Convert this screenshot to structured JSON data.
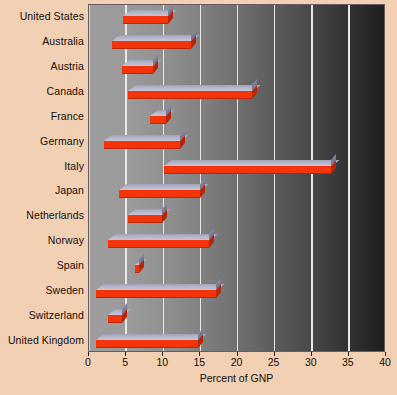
{
  "chart_data": {
    "type": "bar",
    "orientation": "horizontal",
    "title": "",
    "xlabel": "Percent of GNP",
    "ylabel": "",
    "xlim": [
      0,
      40
    ],
    "xticks": [
      0,
      5,
      10,
      15,
      20,
      25,
      30,
      35,
      40
    ],
    "xtick_labels": [
      "0",
      "5",
      "10",
      "15",
      "20",
      "25",
      "30",
      "35",
      "40"
    ],
    "grid": true,
    "legend": false,
    "note": "Floating (range) bars: each country bar spans from a start value to an end value on the Percent of GNP axis.",
    "categories": [
      "United States",
      "Australia",
      "Austria",
      "Canada",
      "France",
      "Germany",
      "Italy",
      "Japan",
      "Netherlands",
      "Norway",
      "Spain",
      "Sweden",
      "Switzerland",
      "United Kingdom"
    ],
    "bars": [
      {
        "category": "United States",
        "start": 4.6,
        "end": 10.7,
        "value": 6.1
      },
      {
        "category": "Australia",
        "start": 3.1,
        "end": 13.7,
        "value": 10.6
      },
      {
        "category": "Austria",
        "start": 4.4,
        "end": 8.6,
        "value": 4.2
      },
      {
        "category": "Canada",
        "start": 5.3,
        "end": 22.0,
        "value": 16.7
      },
      {
        "category": "France",
        "start": 8.2,
        "end": 10.4,
        "value": 2.2
      },
      {
        "category": "Germany",
        "start": 2.0,
        "end": 12.2,
        "value": 10.2
      },
      {
        "category": "Italy",
        "start": 10.1,
        "end": 32.6,
        "value": 22.5
      },
      {
        "category": "Japan",
        "start": 4.1,
        "end": 15.0,
        "value": 10.9
      },
      {
        "category": "Netherlands",
        "start": 5.2,
        "end": 9.8,
        "value": 4.6
      },
      {
        "category": "Norway",
        "start": 2.6,
        "end": 16.2,
        "value": 13.6
      },
      {
        "category": "Spain",
        "start": 6.2,
        "end": 6.8,
        "value": 0.6
      },
      {
        "category": "Sweden",
        "start": 1.0,
        "end": 17.1,
        "value": 16.1
      },
      {
        "category": "Switzerland",
        "start": 2.5,
        "end": 4.5,
        "value": 2.0
      },
      {
        "category": "United Kingdom",
        "start": 1.0,
        "end": 14.7,
        "value": 13.7
      }
    ],
    "colors": {
      "bar_front": "#f4340a",
      "bar_top": "#b6b6cb",
      "page_background": "#f2d0b4",
      "plot_gradient_start": "#9d9d9d",
      "plot_gradient_end": "#1e1e1e",
      "gridline": "#ebe7e4",
      "text": "#140d08",
      "plot_border": "#6a5a62"
    }
  }
}
